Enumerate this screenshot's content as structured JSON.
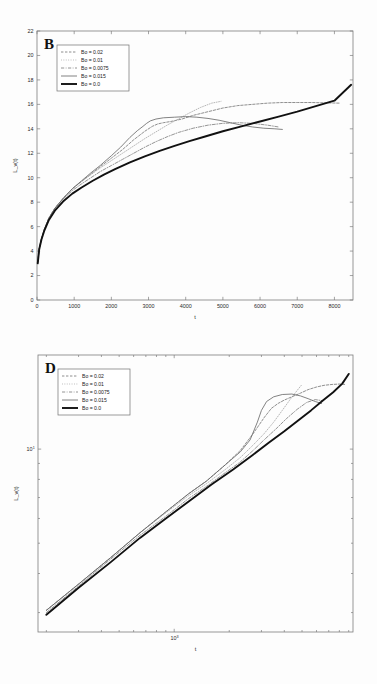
{
  "figure": {
    "background_color": "#fdfdfd",
    "axis_color": "#7d7d7d",
    "text_color": "#2a2a2a"
  },
  "panels": [
    {
      "id": "B",
      "letter": "B",
      "plot_type": "linear"
    },
    {
      "id": "D",
      "letter": "D",
      "plot_type": "loglog"
    }
  ],
  "legend": {
    "position": "upper-left",
    "entries": [
      {
        "label": "Bo = 0.02",
        "style": "dashed-fine",
        "color": "#6a6a6a",
        "width": 0.75
      },
      {
        "label": "Bo = 0.01",
        "style": "dotted",
        "color": "#9a9a9a",
        "width": 0.7
      },
      {
        "label": "Bo = 0.0075",
        "style": "dash-dot",
        "color": "#7a7a7a",
        "width": 0.8
      },
      {
        "label": "Bo = 0.015",
        "style": "solid-thin",
        "color": "#636363",
        "width": 0.8
      },
      {
        "label": "Bo = 0.0",
        "style": "solid-thick",
        "color": "#111111",
        "width": 1.9
      }
    ]
  },
  "chart_data": [
    {
      "type": "line",
      "panel": "B",
      "title": "B",
      "xlabel": "t",
      "ylabel": "L_v(t)",
      "xlim": [
        0,
        8500
      ],
      "ylim": [
        0,
        22
      ],
      "xticks": [
        0,
        1000,
        2000,
        3000,
        4000,
        5000,
        6000,
        7000,
        8000
      ],
      "xticklabels": [
        "0",
        "1000",
        "2000",
        "3000",
        "4000",
        "5000",
        "6000",
        "7000",
        "8000"
      ],
      "yticks": [
        0,
        2,
        4,
        6,
        8,
        10,
        12,
        14,
        16,
        18,
        20,
        22
      ],
      "yticklabels": [
        "0",
        "2",
        "4",
        "6",
        "8",
        "10",
        "12",
        "14",
        "16",
        "18",
        "20",
        "22"
      ],
      "xscale": "linear",
      "yscale": "linear",
      "grid": false,
      "legend_position": "upper-left",
      "series": [
        {
          "name": "Bo = 0.02",
          "x": [
            20,
            60,
            120,
            200,
            320,
            480,
            700,
            950,
            1200,
            1450,
            1700,
            2000,
            2300,
            2600,
            2900,
            3100,
            3250,
            3400,
            3600,
            3900,
            4200,
            4600,
            5000,
            5400,
            5800,
            6200,
            6600,
            7000,
            7400,
            7800,
            8150
          ],
          "y": [
            3.1,
            4.2,
            5.0,
            5.8,
            6.7,
            7.5,
            8.3,
            9.1,
            9.7,
            10.3,
            10.9,
            11.6,
            12.3,
            13.1,
            13.8,
            14.2,
            14.4,
            14.5,
            14.6,
            14.8,
            15.1,
            15.4,
            15.7,
            15.9,
            16.0,
            16.1,
            16.15,
            16.15,
            16.15,
            16.12,
            16.1
          ]
        },
        {
          "name": "Bo = 0.01",
          "x": [
            20,
            60,
            120,
            200,
            320,
            480,
            700,
            950,
            1200,
            1450,
            1700,
            2000,
            2300,
            2600,
            2900,
            3200,
            3500,
            3800,
            4100,
            4400,
            4700,
            4950
          ],
          "y": [
            3.1,
            4.2,
            5.0,
            5.8,
            6.7,
            7.5,
            8.3,
            9.1,
            9.7,
            10.25,
            10.8,
            11.4,
            12.0,
            12.6,
            13.2,
            13.75,
            14.3,
            14.8,
            15.3,
            15.75,
            16.1,
            16.25
          ]
        },
        {
          "name": "Bo = 0.0075",
          "x": [
            20,
            60,
            120,
            200,
            320,
            480,
            700,
            950,
            1200,
            1450,
            1700,
            2000,
            2300,
            2600,
            2900,
            3200,
            3500,
            3800,
            4200,
            4600,
            5000,
            5400,
            5800,
            6200,
            6500
          ],
          "y": [
            3.1,
            4.2,
            5.0,
            5.8,
            6.7,
            7.5,
            8.25,
            8.95,
            9.5,
            10.0,
            10.5,
            11.0,
            11.5,
            12.0,
            12.5,
            12.95,
            13.35,
            13.7,
            14.05,
            14.3,
            14.45,
            14.5,
            14.45,
            14.3,
            14.15
          ]
        },
        {
          "name": "Bo = 0.015",
          "x": [
            20,
            60,
            120,
            200,
            320,
            480,
            700,
            950,
            1200,
            1450,
            1700,
            2000,
            2250,
            2500,
            2700,
            2850,
            2950,
            3050,
            3200,
            3400,
            3700,
            4000,
            4300,
            4600,
            4900,
            5200,
            5500,
            5800,
            6100,
            6400,
            6600
          ],
          "y": [
            3.1,
            4.2,
            5.0,
            5.8,
            6.7,
            7.5,
            8.3,
            9.1,
            9.75,
            10.4,
            11.0,
            11.8,
            12.5,
            13.3,
            13.85,
            14.2,
            14.45,
            14.65,
            14.8,
            14.9,
            14.95,
            15.0,
            14.95,
            14.85,
            14.7,
            14.5,
            14.3,
            14.15,
            14.05,
            14.0,
            13.95
          ]
        },
        {
          "name": "Bo = 0.0",
          "x": [
            20,
            60,
            120,
            200,
            320,
            480,
            700,
            950,
            1200,
            1500,
            1800,
            2100,
            2500,
            2900,
            3300,
            3700,
            4100,
            4500,
            5000,
            5500,
            6000,
            6500,
            7000,
            7500,
            8000,
            8450
          ],
          "y": [
            3.0,
            4.15,
            4.95,
            5.7,
            6.55,
            7.3,
            8.05,
            8.7,
            9.2,
            9.75,
            10.25,
            10.7,
            11.25,
            11.75,
            12.2,
            12.6,
            13.0,
            13.35,
            13.8,
            14.2,
            14.6,
            15.0,
            15.4,
            15.85,
            16.3,
            17.6
          ]
        }
      ]
    },
    {
      "type": "line",
      "panel": "D",
      "title": "D",
      "xlabel": "t",
      "ylabel": "L_v(t)",
      "xlim": [
        180,
        9500
      ],
      "ylim": [
        2.6,
        20.0
      ],
      "xticks": [
        1000
      ],
      "xticklabels": [
        "10^3"
      ],
      "yticks": [
        10
      ],
      "yticklabels": [
        "10^1"
      ],
      "xscale": "log",
      "yscale": "log",
      "grid": false,
      "legend_position": "upper-left",
      "series": [
        {
          "name": "Bo = 0.02",
          "x": [
            200,
            300,
            450,
            650,
            900,
            1200,
            1500,
            1900,
            2300,
            2700,
            3100,
            3400,
            3700,
            4000,
            4400,
            4900,
            5400,
            6000,
            6600,
            7300,
            8000,
            8600
          ],
          "y": [
            3.05,
            3.7,
            4.5,
            5.4,
            6.3,
            7.2,
            7.9,
            8.9,
            9.9,
            11.2,
            12.6,
            13.5,
            14.0,
            14.35,
            14.7,
            15.1,
            15.5,
            15.8,
            16.0,
            16.1,
            16.15,
            16.1
          ]
        },
        {
          "name": "Bo = 0.01",
          "x": [
            200,
            300,
            450,
            650,
            900,
            1200,
            1500,
            1900,
            2300,
            2700,
            3100,
            3500,
            3900,
            4300,
            4700,
            5000
          ],
          "y": [
            3.05,
            3.7,
            4.5,
            5.4,
            6.25,
            7.1,
            7.75,
            8.6,
            9.4,
            10.3,
            11.2,
            12.2,
            13.3,
            14.4,
            15.4,
            16.1
          ]
        },
        {
          "name": "Bo = 0.0075",
          "x": [
            200,
            300,
            450,
            650,
            900,
            1200,
            1500,
            1900,
            2300,
            2700,
            3100,
            3600,
            4100,
            4700,
            5300,
            5900,
            6400
          ],
          "y": [
            3.0,
            3.65,
            4.45,
            5.3,
            6.1,
            6.95,
            7.6,
            8.4,
            9.1,
            9.9,
            10.7,
            11.6,
            12.5,
            13.4,
            14.1,
            14.4,
            14.3
          ]
        },
        {
          "name": "Bo = 0.015",
          "x": [
            200,
            300,
            450,
            650,
            900,
            1200,
            1500,
            1900,
            2300,
            2600,
            2850,
            3000,
            3200,
            3500,
            3900,
            4400,
            4900,
            5400,
            5900,
            6400
          ],
          "y": [
            3.05,
            3.7,
            4.5,
            5.4,
            6.3,
            7.2,
            7.9,
            8.9,
            9.8,
            10.7,
            12.2,
            13.3,
            14.2,
            14.7,
            14.95,
            15.0,
            14.8,
            14.5,
            14.2,
            14.0
          ]
        },
        {
          "name": "Bo = 0.0",
          "x": [
            200,
            300,
            450,
            650,
            900,
            1200,
            1600,
            2100,
            2700,
            3300,
            4000,
            4800,
            5600,
            6500,
            7400,
            8300,
            9000
          ],
          "y": [
            2.95,
            3.6,
            4.35,
            5.2,
            6.0,
            6.8,
            7.7,
            8.6,
            9.6,
            10.5,
            11.4,
            12.4,
            13.3,
            14.3,
            15.2,
            16.2,
            17.4
          ]
        }
      ]
    }
  ]
}
